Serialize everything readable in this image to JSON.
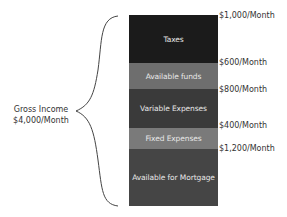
{
  "gross_income": {
    "line1": "Gross Income",
    "line2": "$4,000/Month"
  },
  "segments": [
    {
      "label": "Taxes",
      "amount": "$1,000/Month",
      "color": "#1b1b1b"
    },
    {
      "label": "Available funds",
      "amount": "$600/Month",
      "color": "#6e6e6e"
    },
    {
      "label": "Variable Expenses",
      "amount": "$800/Month",
      "color": "#3a3a3a"
    },
    {
      "label": "Fixed Expenses",
      "amount": "$400/Month",
      "color": "#7a7a7a"
    },
    {
      "label": "Available for Mortgage",
      "amount": "$1,200/Month",
      "color": "#454545"
    }
  ]
}
